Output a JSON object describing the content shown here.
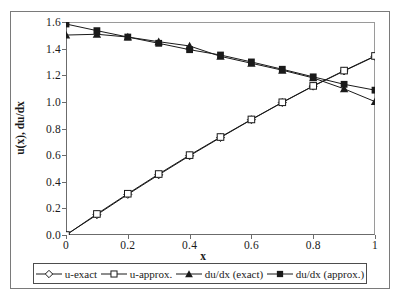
{
  "chart_data": {
    "type": "line",
    "title": "",
    "xlabel": "x",
    "ylabel": "u(x), du/dx",
    "xlim": [
      0,
      1
    ],
    "ylim": [
      0,
      1.6
    ],
    "grid": false,
    "legend_position": "bottom",
    "xticks": [
      "0",
      "0.2",
      "0.4",
      "0.6",
      "0.8",
      "1"
    ],
    "xtick_values": [
      0,
      0.2,
      0.4,
      0.6,
      0.8,
      1
    ],
    "yticks": [
      "0.0",
      "0.2",
      "0.4",
      "0.6",
      "0.8",
      "1.0",
      "1.2",
      "1.4",
      "1.6"
    ],
    "ytick_values": [
      0,
      0.2,
      0.4,
      0.6,
      0.8,
      1.0,
      1.2,
      1.4,
      1.6
    ],
    "x": [
      0,
      0.1,
      0.2,
      0.3,
      0.4,
      0.5,
      0.6,
      0.7,
      0.8,
      0.9,
      1
    ],
    "series": [
      {
        "name": "u-exact",
        "marker": "open-diamond",
        "color": "#1a1a1a",
        "values": [
          0.0,
          0.152,
          0.305,
          0.452,
          0.595,
          0.732,
          0.866,
          0.995,
          1.118,
          1.232,
          1.342
        ]
      },
      {
        "name": "u-approx.",
        "marker": "open-square",
        "color": "#1a1a1a",
        "values": [
          0.0,
          0.158,
          0.31,
          0.458,
          0.6,
          0.736,
          0.868,
          0.997,
          1.12,
          1.235,
          1.345
        ]
      },
      {
        "name": "du/dx (exact)",
        "marker": "filled-triangle",
        "color": "#1a1a1a",
        "values": [
          1.502,
          1.508,
          1.487,
          1.452,
          1.42,
          1.342,
          1.29,
          1.238,
          1.18,
          1.098,
          1.002
        ]
      },
      {
        "name": "du/dx (approx.)",
        "marker": "filled-square",
        "color": "#1a1a1a",
        "values": [
          1.585,
          1.535,
          1.487,
          1.44,
          1.392,
          1.352,
          1.3,
          1.245,
          1.188,
          1.132,
          1.088
        ]
      }
    ]
  },
  "legend": {
    "entries": [
      {
        "label": "u-exact"
      },
      {
        "label": "u-approx."
      },
      {
        "label": "du/dx (exact)"
      },
      {
        "label": "du/dx (approx.)"
      }
    ]
  }
}
